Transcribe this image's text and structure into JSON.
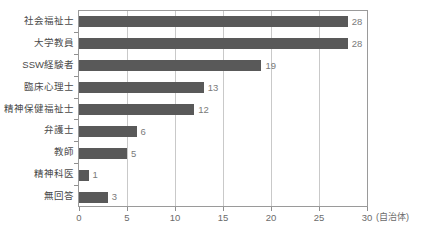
{
  "chart_data": {
    "type": "bar",
    "orientation": "horizontal",
    "title": "",
    "xlabel": "(自治体)",
    "ylabel": "",
    "xlim": [
      0,
      30
    ],
    "xticks": [
      "0",
      "5",
      "10",
      "15",
      "20",
      "25",
      "30"
    ],
    "grid": "vertical",
    "legend": "none",
    "bar_color": "#595959",
    "categories": [
      "社会福祉士",
      "大学教員",
      "SSW経験者",
      "臨床心理士",
      "精神保健福祉士",
      "弁護士",
      "教師",
      "精神科医",
      "無回答"
    ],
    "values": [
      28,
      28,
      19,
      13,
      12,
      6,
      5,
      1,
      3
    ],
    "value_labels": [
      "28",
      "28",
      "19",
      "13",
      "12",
      "6",
      "5",
      "1",
      "3"
    ]
  }
}
